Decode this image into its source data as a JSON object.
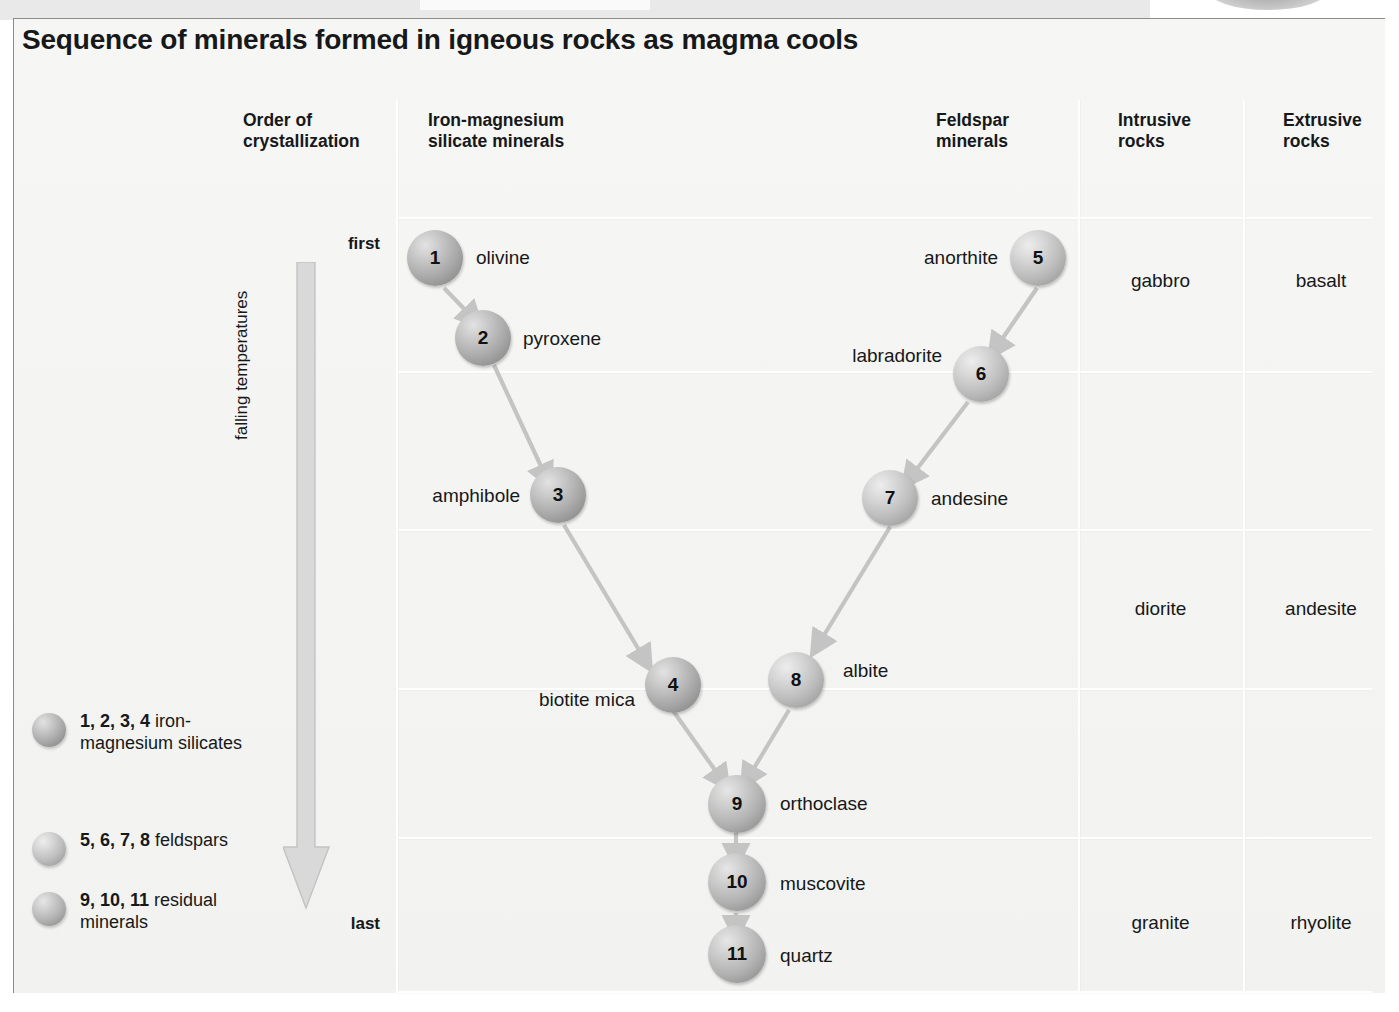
{
  "figure": {
    "title": "Sequence of minerals formed in igneous rocks as magma cools",
    "axis_label": "falling temperatures",
    "first_label": "first",
    "last_label": "last"
  },
  "columns": [
    {
      "id": "order",
      "line1": "Order of",
      "line2": "crystallization"
    },
    {
      "id": "ferromag",
      "line1": "Iron-magnesium",
      "line2": "silicate minerals"
    },
    {
      "id": "feldspar",
      "line1": "Feldspar",
      "line2": "minerals"
    },
    {
      "id": "intrusive",
      "line1": "Intrusive",
      "line2": "rocks"
    },
    {
      "id": "extrusive",
      "line1": "Extrusive",
      "line2": "rocks"
    }
  ],
  "nodes": [
    {
      "num": "1",
      "name": "olivine",
      "group": "iron-magnesium-silicates"
    },
    {
      "num": "2",
      "name": "pyroxene",
      "group": "iron-magnesium-silicates"
    },
    {
      "num": "3",
      "name": "amphibole",
      "group": "iron-magnesium-silicates"
    },
    {
      "num": "4",
      "name": "biotite mica",
      "group": "iron-magnesium-silicates"
    },
    {
      "num": "5",
      "name": "anorthite",
      "group": "feldspars"
    },
    {
      "num": "6",
      "name": "labradorite",
      "group": "feldspars"
    },
    {
      "num": "7",
      "name": "andesine",
      "group": "feldspars"
    },
    {
      "num": "8",
      "name": "albite",
      "group": "feldspars"
    },
    {
      "num": "9",
      "name": "orthoclase",
      "group": "residual-minerals"
    },
    {
      "num": "10",
      "name": "muscovite",
      "group": "residual-minerals"
    },
    {
      "num": "11",
      "name": "quartz",
      "group": "residual-minerals"
    }
  ],
  "rocks": [
    {
      "intrusive": "gabbro",
      "extrusive": "basalt"
    },
    {
      "intrusive": "diorite",
      "extrusive": "andesite"
    },
    {
      "intrusive": "granite",
      "extrusive": "rhyolite"
    }
  ],
  "legend": [
    {
      "nums": "1, 2, 3, 4",
      "text": " iron-magnesium silicates"
    },
    {
      "nums": "5, 6, 7, 8",
      "text": " feldspars"
    },
    {
      "nums": "9, 10, 11",
      "text": " residual minerals"
    }
  ],
  "colors": {
    "page_background": "#f4f4f2",
    "frame_border": "#8b8b8b",
    "text": "#16181a",
    "gridline": "#ffffff",
    "arrow_fill": "#d7d7d7",
    "arrow_stroke": "#bdbdbd",
    "connector": "#c6c6c6"
  }
}
